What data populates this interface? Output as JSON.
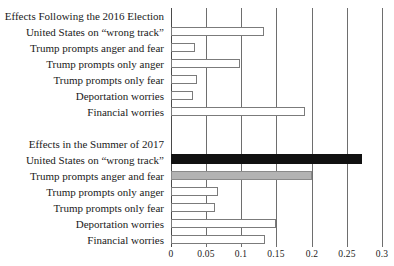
{
  "chart_data": {
    "type": "bar",
    "orientation": "horizontal",
    "title": "",
    "xlabel": "",
    "ylabel": "",
    "xlim": [
      0,
      0.3
    ],
    "xticks": [
      0,
      0.05,
      0.1,
      0.15,
      0.2,
      0.25,
      0.3
    ],
    "xticklabels": [
      "0",
      "0.05",
      "0.1",
      "0.15",
      "0.2",
      "0.25",
      "0.3"
    ],
    "grid": true,
    "legend": "none",
    "panels": [
      {
        "section_label": "Effects Following the 2016 Election",
        "categories": [
          "United States on “wrong track”",
          "Trump prompts anger and fear",
          "Trump prompts only anger",
          "Trump prompts only fear",
          "Deportation worries",
          "Financial worries"
        ],
        "values": [
          0.132,
          0.034,
          0.098,
          0.037,
          0.031,
          0.19
        ],
        "styles": [
          "open",
          "open",
          "open",
          "open",
          "open",
          "open"
        ]
      },
      {
        "section_label": "Effects in the Summer of 2017",
        "categories": [
          "United States on “wrong track”",
          "Trump prompts anger and fear",
          "Trump prompts only anger",
          "Trump prompts only fear",
          "Deportation worries",
          "Financial worries"
        ],
        "values": [
          0.271,
          0.2,
          0.067,
          0.062,
          0.149,
          0.133
        ],
        "styles": [
          "solid-black",
          "solid-gray",
          "open",
          "open",
          "open",
          "open"
        ]
      }
    ],
    "colors": {
      "bar_outline": "#7b7b7b",
      "bar_fill": "#ffffff",
      "highlight_black": "#111111",
      "highlight_gray": "#b3b3b3",
      "gridline": "#6e6e6e",
      "text": "#1a1a1a"
    }
  }
}
